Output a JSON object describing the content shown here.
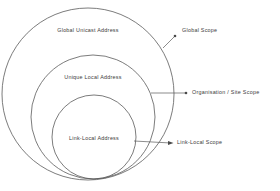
{
  "diagram": {
    "type": "nested-circles",
    "background_color": "#ffffff",
    "stroke_color": "#5a5a5a",
    "text_color": "#3c3c3c",
    "rings": [
      {
        "id": "global-unicast",
        "label": "Global Unicast Address",
        "label_x": 88,
        "label_y": 31,
        "cx": 88,
        "cy": 94,
        "r": 86
      },
      {
        "id": "unique-local",
        "label": "Unique Local Address",
        "label_x": 93,
        "label_y": 78,
        "cx": 93,
        "cy": 117,
        "r": 62
      },
      {
        "id": "link-local",
        "label": "Link-Local Address",
        "label_x": 94,
        "label_y": 139,
        "cx": 94,
        "cy": 137,
        "r": 42
      }
    ],
    "callouts": [
      {
        "id": "global-scope",
        "label": "Global Scope",
        "label_x": 182,
        "label_y": 31,
        "dot_x": 175,
        "dot_y": 36,
        "line_points": "163,48 175,36"
      },
      {
        "id": "organisation-site-scope",
        "label": "Organisation / Site Scope",
        "label_x": 192,
        "label_y": 93,
        "dot_x": 186,
        "dot_y": 93,
        "line_points": "151,93 186,93"
      },
      {
        "id": "link-local-scope",
        "label": "Link-Local Scope",
        "label_x": 177,
        "label_y": 143,
        "dot_x": 171,
        "dot_y": 143,
        "line_points": "134,141 171,143"
      }
    ]
  }
}
